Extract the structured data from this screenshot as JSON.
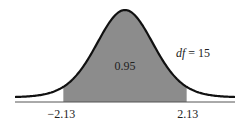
{
  "chart_data": {
    "type": "area",
    "title": "",
    "distribution": "Student's t",
    "df": 15,
    "df_label": "df = 15",
    "df_label_italic": "df",
    "df_label_rest": " = 15",
    "shaded_region": {
      "from": -2.13,
      "to": 2.13,
      "probability": 0.95
    },
    "center_annotation": "0.95",
    "tick_labels": [
      "−2.13",
      "2.13"
    ],
    "tick_values": [
      -2.13,
      2.13
    ],
    "xlim": [
      -3.8,
      3.8
    ],
    "xlabel": "",
    "ylabel": "",
    "grid": false,
    "colors": {
      "shade": "#8c8c8c",
      "curve": "#111111",
      "baseline": "#555555"
    }
  }
}
